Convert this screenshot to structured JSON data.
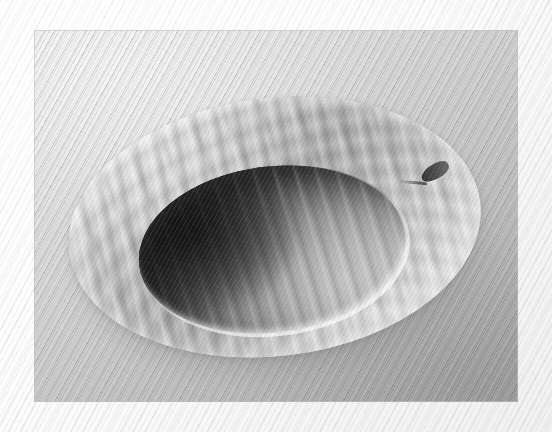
{
  "image": {
    "subject": "turned wooden bowl",
    "medium": "black and white photograph",
    "caption": "Grayscale photograph of a shallow turned wooden bowl with curly figured grain, resting on a lightly textured surface",
    "orientation": "landscape",
    "canvas": {
      "width": 552,
      "height": 432
    },
    "photo_inset": {
      "left": 34,
      "top": 30,
      "width": 484,
      "height": 372
    }
  },
  "frame": {
    "name": "mat-border",
    "style": "white textured mat with fine diagonal weave",
    "color": "#fbfbfb",
    "weave_color": "#afafaf"
  },
  "background": {
    "name": "ground-surface",
    "description": "finely striated surface lit from upper left, falling into shadow toward lower right",
    "light_color": "#ededed",
    "mid_color": "#c2c2c2",
    "dark_color": "#a4a4a4",
    "texture": "fine diagonal lines"
  },
  "bowl": {
    "name": "wooden-bowl",
    "material": "figured maple",
    "grain": "curly flame figure with chevron growth rings",
    "rotation_deg": -7,
    "rim": {
      "name": "bowl-rim",
      "description": "wide flat flange surrounding the hollow",
      "light_color": "#d4d4d4",
      "mid_color": "#bdbdbd",
      "shadow_color": "#b3b3b3"
    },
    "cavity": {
      "name": "bowl-cavity",
      "description": "hollowed interior, deeply shadowed on the near left wall, lit on the far right wall",
      "highlight_color": "#b9b9b9",
      "shadow_color": "#313131",
      "lip_highlight": "#ffffff"
    },
    "defect": {
      "name": "rim-notch",
      "description": "small dark chipped notch with a hairline crack on the far upper-right rim",
      "color": "#2e2e2e"
    },
    "cast_shadow": {
      "name": "cast-shadow",
      "color": "#5c5c5c"
    }
  }
}
